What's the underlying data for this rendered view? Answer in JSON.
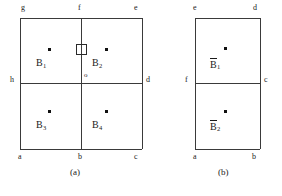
{
  "figures": [
    {
      "id": "figure-a",
      "caption": "(a)",
      "caption_pos": {
        "x": 70,
        "y": 168
      },
      "frame": {
        "x": 20,
        "y": 18,
        "w": 122,
        "h": 131
      },
      "dividers": {
        "vertical_x": 81,
        "horizontal_y": 83
      },
      "vertices": [
        {
          "name": "g",
          "label": "g",
          "x": 21,
          "y": 4
        },
        {
          "name": "f",
          "label": "f",
          "x": 78,
          "y": 4
        },
        {
          "name": "e",
          "label": "e",
          "x": 134,
          "y": 4
        },
        {
          "name": "h",
          "label": "h",
          "x": 10,
          "y": 76
        },
        {
          "name": "d",
          "label": "d",
          "x": 146,
          "y": 76
        },
        {
          "name": "a",
          "label": "a",
          "x": 18,
          "y": 153
        },
        {
          "name": "b",
          "label": "b",
          "x": 78,
          "y": 153
        },
        {
          "name": "c",
          "label": "c",
          "x": 134,
          "y": 153
        }
      ],
      "origin": {
        "name": "o",
        "label": "o",
        "x": 84,
        "y": 72
      },
      "regions": [
        {
          "name": "B1",
          "base": "B",
          "sub": "1",
          "overbar": false,
          "label_x": 36,
          "label_y": 58,
          "dot_x": 48,
          "dot_y": 48
        },
        {
          "name": "B2",
          "base": "B",
          "sub": "2",
          "overbar": false,
          "label_x": 92,
          "label_y": 58,
          "dot_x": 105,
          "dot_y": 48
        },
        {
          "name": "B3",
          "base": "B",
          "sub": "3",
          "overbar": false,
          "label_x": 36,
          "label_y": 120,
          "dot_x": 48,
          "dot_y": 110
        },
        {
          "name": "B4",
          "base": "B",
          "sub": "4",
          "overbar": false,
          "label_x": 92,
          "label_y": 120,
          "dot_x": 105,
          "dot_y": 110
        }
      ],
      "square_marker": {
        "name": "square-marker",
        "x": 76,
        "y": 44,
        "w": 11,
        "h": 11
      }
    },
    {
      "id": "figure-b",
      "caption": "(b)",
      "caption_pos": {
        "x": 218,
        "y": 168
      },
      "frame": {
        "x": 195,
        "y": 18,
        "w": 65,
        "h": 131
      },
      "dividers": {
        "vertical_x": null,
        "horizontal_y": 83
      },
      "vertices": [
        {
          "name": "e",
          "label": "e",
          "x": 193,
          "y": 4
        },
        {
          "name": "d",
          "label": "d",
          "x": 253,
          "y": 4
        },
        {
          "name": "f",
          "label": "f",
          "x": 185,
          "y": 76
        },
        {
          "name": "c",
          "label": "c",
          "x": 264,
          "y": 76
        },
        {
          "name": "a",
          "label": "a",
          "x": 193,
          "y": 153
        },
        {
          "name": "b",
          "label": "b",
          "x": 252,
          "y": 153
        }
      ],
      "origin": null,
      "regions": [
        {
          "name": "Bbar1",
          "base": "B",
          "sub": "1",
          "overbar": true,
          "label_x": 210,
          "label_y": 58,
          "dot_x": 224,
          "dot_y": 47
        },
        {
          "name": "Bbar2",
          "base": "B",
          "sub": "2",
          "overbar": true,
          "label_x": 210,
          "label_y": 120,
          "dot_x": 224,
          "dot_y": 110
        }
      ],
      "square_marker": null
    }
  ],
  "style": {
    "line_color": "#3a3a3a",
    "text_color": "#1a1a1a",
    "background": "#ffffff"
  }
}
